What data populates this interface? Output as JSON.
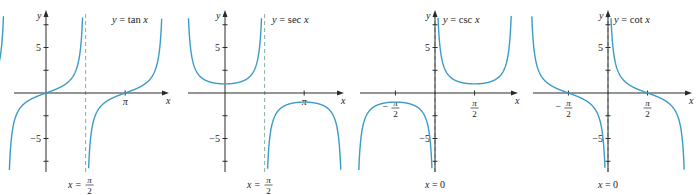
{
  "figure": {
    "colors": {
      "curve": "#3a9bc8",
      "asymptote": "#8fb9a4",
      "axis": "#2a2a2a"
    }
  },
  "chart_data": [
    {
      "type": "line",
      "title": "y = tan x",
      "function": "tan",
      "xlabel": "x",
      "ylabel": "y",
      "xlim": [
        -2.1,
        5.3
      ],
      "ylim": [
        -8.5,
        8.5
      ],
      "y_ticks": [
        -7.5,
        -5,
        -2.5,
        2.5,
        5,
        7.5
      ],
      "y_tick_labels": [
        {
          "value": 5,
          "label": "5"
        },
        {
          "value": -5,
          "label": "−5"
        }
      ],
      "x_ticks": [
        {
          "value": 3.14159,
          "label": "π"
        }
      ],
      "asymptote": {
        "x": 1.5708,
        "label_lhs": "x",
        "label_num": "π",
        "label_den": "2"
      },
      "plot_range": [
        -2.0,
        4.6
      ],
      "grid": false
    },
    {
      "type": "line",
      "title": "y = sec x",
      "function": "sec",
      "xlabel": "x",
      "ylabel": "y",
      "xlim": [
        -2.1,
        5.3
      ],
      "ylim": [
        -8.5,
        8.5
      ],
      "y_ticks": [
        -7.5,
        -5,
        -2.5,
        2.5,
        5,
        7.5
      ],
      "y_tick_labels": [
        {
          "value": 5,
          "label": "5"
        },
        {
          "value": -5,
          "label": "−5"
        }
      ],
      "x_ticks": [
        {
          "value": 3.14159,
          "label": "π"
        }
      ],
      "asymptote": {
        "x": 1.5708,
        "label_lhs": "x",
        "label_num": "π",
        "label_den": "2"
      },
      "plot_range": [
        -1.57,
        4.71
      ],
      "grid": false
    },
    {
      "type": "line",
      "title": "y = csc x",
      "function": "csc",
      "xlabel": "x",
      "ylabel": "y",
      "xlim": [
        -3.6,
        3.9
      ],
      "ylim": [
        -8.5,
        8.5
      ],
      "y_ticks": [
        -7.5,
        -5,
        -2.5,
        2.5,
        5,
        7.5
      ],
      "y_tick_labels": [
        {
          "value": 5,
          "label": "5"
        },
        {
          "value": -5,
          "label": "−5"
        }
      ],
      "x_ticks": [
        {
          "value": -1.5708,
          "label_num": "π",
          "label_den": "2",
          "neg": true
        },
        {
          "value": 1.5708,
          "label_num": "π",
          "label_den": "2",
          "neg": false
        }
      ],
      "asymptote": {
        "x": 0,
        "label_lhs": "x = 0"
      },
      "plot_range": [
        -3.14,
        3.14
      ],
      "grid": false
    },
    {
      "type": "line",
      "title": "y = cot x",
      "function": "cot",
      "xlabel": "x",
      "ylabel": "y",
      "xlim": [
        -3.6,
        3.9
      ],
      "ylim": [
        -8.5,
        8.5
      ],
      "y_ticks": [
        -7.5,
        -5,
        -2.5,
        2.5,
        5,
        7.5
      ],
      "y_tick_labels": [
        {
          "value": 5,
          "label": "5"
        },
        {
          "value": -5,
          "label": "−5"
        }
      ],
      "x_ticks": [
        {
          "value": -1.5708,
          "label_num": "π",
          "label_den": "2",
          "neg": true
        },
        {
          "value": 1.5708,
          "label_num": "π",
          "label_den": "2",
          "neg": false
        }
      ],
      "asymptote": {
        "x": 0,
        "label_lhs": "x = 0"
      },
      "plot_range": [
        -3.14,
        3.14
      ],
      "grid": false
    }
  ],
  "panels": [
    {
      "originX": 46,
      "originY": 93,
      "left": 14,
      "right": 165,
      "top": 14,
      "bottom": 172,
      "title_x": 112,
      "title_y": 23
    },
    {
      "originX": 225,
      "originY": 93,
      "left": 188,
      "right": 340,
      "top": 14,
      "bottom": 172,
      "title_x": 272,
      "title_y": 23
    },
    {
      "originX": 435,
      "originY": 93,
      "left": 360,
      "right": 514,
      "top": 14,
      "bottom": 172,
      "title_x": 443,
      "title_y": 23
    },
    {
      "originX": 608,
      "originY": 93,
      "left": 533,
      "right": 688,
      "top": 14,
      "bottom": 172,
      "title_x": 614,
      "title_y": 23
    }
  ]
}
